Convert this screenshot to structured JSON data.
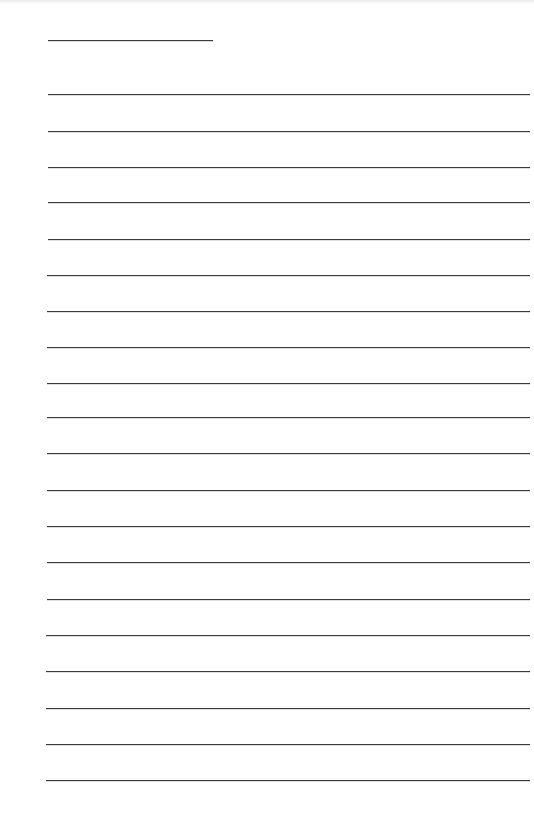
{
  "document": {
    "type": "lined-paper",
    "line_color": "#3a3a3a",
    "background_color": "#ffffff",
    "header_line": {
      "x1": 48,
      "x2": 213,
      "y": 40
    },
    "body_lines": {
      "x1": 48,
      "x2": 530,
      "y_positions": [
        94,
        131,
        167,
        202,
        239,
        275,
        311,
        347,
        383,
        417,
        453,
        490,
        526,
        562,
        599,
        635,
        671,
        708,
        744,
        780
      ]
    }
  }
}
